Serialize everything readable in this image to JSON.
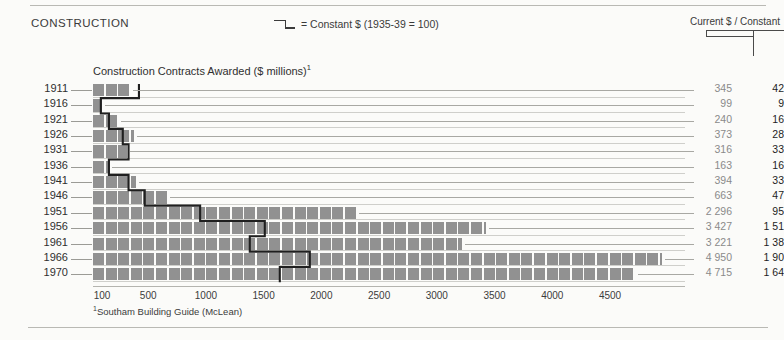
{
  "header": {
    "section_title": "CONSTRUCTION",
    "legend_text": "= Constant $ (1935-39 = 100)",
    "columns_header": "Current $ / Constant"
  },
  "chart_title": "Construction Contracts Awarded ($ millions)",
  "chart_title_footnote_marker": "1",
  "footnote": "Southam Building Guide (McLean)",
  "footnote_marker": "1",
  "colors": {
    "bar_fill": "#919191",
    "step_line": "#1f1f1f",
    "gridline": "#cfcfcb",
    "current_value_text": "#8a8a8a",
    "constant_value_text": "#1d1d1d",
    "page_background": "#fbfbf9"
  },
  "chart_data": {
    "type": "bar",
    "title": "Construction Contracts Awarded ($ millions)",
    "xlabel": "",
    "ylabel": "",
    "orientation": "horizontal",
    "grid": true,
    "legend_position": "top-center",
    "xlim": [
      0,
      5000
    ],
    "xticks": [
      100,
      500,
      1000,
      1500,
      2000,
      2500,
      3000,
      3500,
      4000,
      4500
    ],
    "categories": [
      "1911",
      "1916",
      "1921",
      "1926",
      "1931",
      "1936",
      "1941",
      "1946",
      "1951",
      "1956",
      "1961",
      "1966",
      "1970"
    ],
    "series": [
      {
        "name": "Current $",
        "values": [
          345,
          99,
          240,
          373,
          316,
          163,
          394,
          663,
          2296,
          3427,
          3221,
          4950,
          4715
        ]
      },
      {
        "name": "Constant $ (1935-39 = 100)",
        "values": [
          420,
          90,
          160,
          280,
          330,
          160,
          330,
          470,
          950,
          1510,
          1380,
          1900,
          1640
        ]
      }
    ]
  },
  "rows": [
    {
      "year": "1911",
      "current_label": "345",
      "constant_label": "42"
    },
    {
      "year": "1916",
      "current_label": "99",
      "constant_label": "9"
    },
    {
      "year": "1921",
      "current_label": "240",
      "constant_label": "16"
    },
    {
      "year": "1926",
      "current_label": "373",
      "constant_label": "28"
    },
    {
      "year": "1931",
      "current_label": "316",
      "constant_label": "33"
    },
    {
      "year": "1936",
      "current_label": "163",
      "constant_label": "16"
    },
    {
      "year": "1941",
      "current_label": "394",
      "constant_label": "33"
    },
    {
      "year": "1946",
      "current_label": "663",
      "constant_label": "47"
    },
    {
      "year": "1951",
      "current_label": "2 296",
      "constant_label": "95"
    },
    {
      "year": "1956",
      "current_label": "3 427",
      "constant_label": "1 51"
    },
    {
      "year": "1961",
      "current_label": "3 221",
      "constant_label": "1 38"
    },
    {
      "year": "1966",
      "current_label": "4 950",
      "constant_label": "1 90"
    },
    {
      "year": "1970",
      "current_label": "4 715",
      "constant_label": "1 64"
    }
  ]
}
